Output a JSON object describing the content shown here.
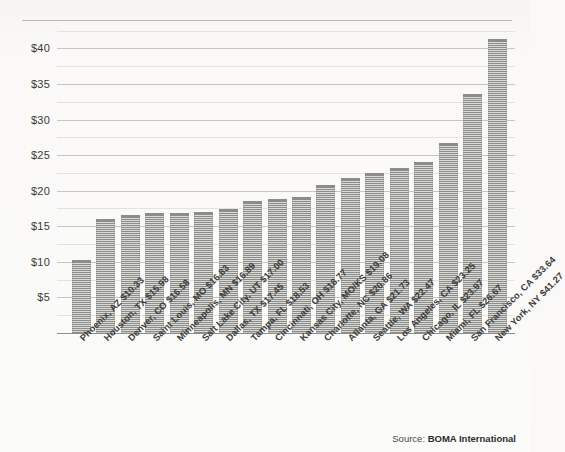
{
  "figure": {
    "background_color": "#faf9f7",
    "bar_color": "#8c8c8a",
    "bar_highlight_color": "#d9d9d6",
    "gridline_color": "#c6c6c4",
    "axis_color": "#8e8e8c"
  },
  "source": {
    "label": "Source:",
    "name": "BOMA International"
  },
  "chart_data": {
    "type": "bar",
    "title": "",
    "subtitle": "",
    "xlabel": "",
    "ylabel": "",
    "ylim": [
      0,
      43
    ],
    "grid": true,
    "legend": "none",
    "orientation": "vertical",
    "ytick_labels": [
      "$40",
      "$35",
      "$30",
      "$25",
      "$20",
      "$15",
      "$10",
      "$5"
    ],
    "ytick_values": [
      40,
      35,
      30,
      25,
      20,
      15,
      10,
      5
    ],
    "categories": [
      "Phoenix, AZ",
      "Houston, TX",
      "Denver, CO",
      "Saint Louis, MO",
      "Minneapolis, MN",
      "Salt Lake City, UT",
      "Dallas, TX",
      "Tampa, FL",
      "Cincinnati, OH",
      "Kansas City, MO/KS",
      "Charlotte, NC",
      "Atlanta, GA",
      "Seattle, WA",
      "Los Angeles, CA",
      "Chicago, IL",
      "Miami, FL",
      "San Francisco, CA",
      "New York, NY"
    ],
    "values": [
      10.33,
      15.98,
      16.58,
      16.83,
      16.89,
      17.0,
      17.45,
      18.53,
      18.77,
      19.08,
      20.86,
      21.73,
      22.47,
      23.25,
      23.97,
      26.67,
      33.64,
      41.27
    ],
    "value_labels": [
      "$10.33",
      "$15.98",
      "$16.58",
      "$16.83",
      "$16.89",
      "$17.00",
      "$17.45",
      "$18.53",
      "$18.77",
      "$19.08",
      "$20.86",
      "$21.73",
      "$22.47",
      "$23.25",
      "$23.97",
      "$26.67",
      "$33.64",
      "$41.27"
    ],
    "tick_labels": [
      "Phoenix, AZ $10.33",
      "Houston, TX $15.98",
      "Denver, CO $16.58",
      "Saint Louis, MO $16.83",
      "Minneapolis, MN $16.89",
      "Salt Lake City, UT $17.00",
      "Dallas, TX $17.45",
      "Tampa, FL $18.53",
      "Cincinnati, OH $18.77",
      "Kansas City, MO/KS $19.08",
      "Charlotte, NC $20.86",
      "Atlanta, GA $21.73",
      "Seattle, WA $22.47",
      "Los Angeles, CA $23.25",
      "Chicago, IL $23.97",
      "Miami, FL $26.67",
      "San Francisco, CA $33.64",
      "New York, NY $41.27"
    ]
  }
}
